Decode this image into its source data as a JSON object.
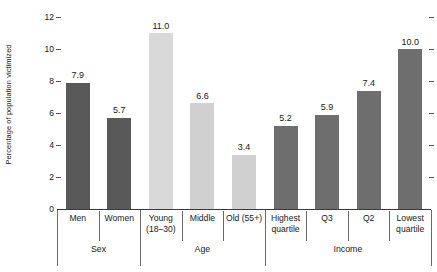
{
  "chart_data": {
    "type": "bar",
    "title": "",
    "xlabel": "",
    "ylabel": "Percentage of population victimized",
    "ylim": [
      0,
      12
    ],
    "yticks": [
      0,
      2,
      4,
      6,
      8,
      10,
      12
    ],
    "ytick_labels": [
      "0",
      "2",
      "4",
      "6",
      "8",
      "10",
      "12"
    ],
    "grid": false,
    "legend": "none",
    "categories": [
      "Men",
      "Women",
      "Young (18–30)",
      "Middle",
      "Old (55+)",
      "Highest quartile",
      "Q3",
      "Q2",
      "Lowest quartile"
    ],
    "values": [
      7.9,
      5.7,
      11.0,
      6.6,
      3.4,
      5.2,
      5.9,
      7.4,
      10.0
    ],
    "value_labels": [
      "7.9",
      "5.7",
      "11.0",
      "6.6",
      "3.4",
      "5.2",
      "5.9",
      "7.4",
      "10.0"
    ],
    "groups": [
      {
        "name": "Sex",
        "categories": [
          "Men",
          "Women"
        ],
        "color": "#595959"
      },
      {
        "name": "Age",
        "categories": [
          "Young (18–30)",
          "Middle",
          "Old (55+)"
        ],
        "color": "#d2d2d2"
      },
      {
        "name": "Income",
        "categories": [
          "Highest quartile",
          "Q3",
          "Q2",
          "Lowest quartile"
        ],
        "color": "#6e6e6e"
      }
    ],
    "bars": [
      {
        "label_line1": "Men",
        "label_line2": "",
        "value": 7.9,
        "value_label": "7.9",
        "group": "Sex",
        "color": "#595959"
      },
      {
        "label_line1": "Women",
        "label_line2": "",
        "value": 5.7,
        "value_label": "5.7",
        "group": "Sex",
        "color": "#595959"
      },
      {
        "label_line1": "Young",
        "label_line2": "(18–30)",
        "value": 11.0,
        "value_label": "11.0",
        "group": "Age",
        "color": "#d9d9d9"
      },
      {
        "label_line1": "Middle",
        "label_line2": "",
        "value": 6.6,
        "value_label": "6.6",
        "group": "Age",
        "color": "#d0d0d0"
      },
      {
        "label_line1": "Old (55+)",
        "label_line2": "",
        "value": 3.4,
        "value_label": "3.4",
        "group": "Age",
        "color": "#d0d0d0"
      },
      {
        "label_line1": "Highest",
        "label_line2": "quartile",
        "value": 5.2,
        "value_label": "5.2",
        "group": "Income",
        "color": "#6e6e6e"
      },
      {
        "label_line1": "Q3",
        "label_line2": "",
        "value": 5.9,
        "value_label": "5.9",
        "group": "Income",
        "color": "#6e6e6e"
      },
      {
        "label_line1": "Q2",
        "label_line2": "",
        "value": 7.4,
        "value_label": "7.4",
        "group": "Income",
        "color": "#6e6e6e"
      },
      {
        "label_line1": "Lowest",
        "label_line2": "quartile",
        "value": 10.0,
        "value_label": "10.0",
        "group": "Income",
        "color": "#6e6e6e"
      }
    ],
    "group_labels": [
      "Sex",
      "Age",
      "Income"
    ],
    "colors": {
      "sex_bar": "#595959",
      "age_bar": "#d4d4d4",
      "income_bar": "#6e6e6e",
      "axis": "#3a3a3a",
      "text": "#1a1a1a"
    }
  }
}
